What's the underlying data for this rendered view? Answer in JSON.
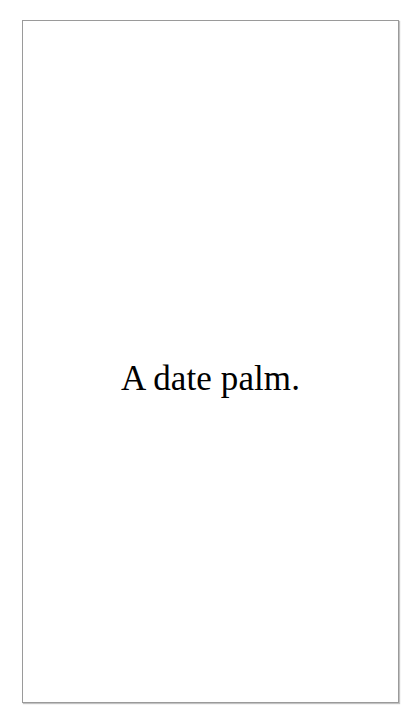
{
  "page": {
    "background_color": "#ffffff",
    "frame": {
      "border_color": "#9a9a9a",
      "fill_color": "#ffffff"
    },
    "body": {
      "text_color": "#000000",
      "caption": "A date palm."
    }
  }
}
